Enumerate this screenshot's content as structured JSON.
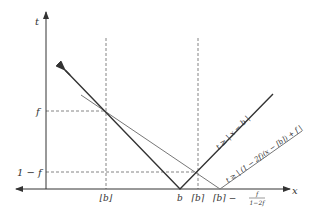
{
  "diagram": {
    "axes": {
      "x_label": "x",
      "y_label": "t"
    },
    "y_ticks": [
      {
        "label": "f"
      },
      {
        "label": "1 − f"
      }
    ],
    "x_ticks": [
      {
        "label": "⌊b⌋"
      },
      {
        "label": "b"
      },
      {
        "label": "⌈b⌉"
      },
      {
        "label": "⌈b⌉ −",
        "fraction_num": "f",
        "fraction_den": "1−2f"
      }
    ],
    "curves": [
      {
        "name": "abs-constraint",
        "label": "t ≥ | x − b |",
        "color": "#333333"
      },
      {
        "name": "relaxed-constraint",
        "label": "t ≥ | (1 − 2f)(x − ⌈b⌉) + f |",
        "color": "#777777"
      }
    ]
  }
}
